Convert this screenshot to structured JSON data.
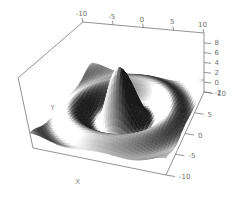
{
  "figure": {
    "background": "#ffffff"
  },
  "chart_data": {
    "type": "3d-surface",
    "title": "",
    "xlabel": "X",
    "ylabel": "Y",
    "zlabel": "",
    "x_range": [
      -10,
      10
    ],
    "y_range": [
      -10,
      10
    ],
    "z_range": [
      -2,
      10
    ],
    "z_function": "z = 8*sin(r)/r with r = sqrt(x^2 + y^2)  (sombrero surface)",
    "amplitude": 8,
    "grid_n": 48,
    "x_ticks": [
      "-10",
      "-5",
      "0",
      "5",
      "10"
    ],
    "x_tick_values": [
      -10,
      -5,
      0,
      5,
      10
    ],
    "y_ticks": [
      "10",
      "5",
      "0",
      "-5",
      "-10"
    ],
    "y_tick_values": [
      10,
      5,
      0,
      -5,
      -10
    ],
    "z_ticks": [
      "8",
      "6",
      "4",
      "2",
      "0",
      "-2"
    ],
    "z_tick_values": [
      8,
      6,
      4,
      2,
      0,
      -2
    ],
    "grid": false,
    "legend": "none",
    "shading": "grayscale-lambert",
    "light_direction": [
      -0.6,
      -0.35,
      0.72
    ],
    "colors": {
      "background": "#ffffff",
      "axis_line": "#777777",
      "tick_label": "#6e6e6e",
      "axis_title": "#8a8a8a",
      "surface_highlight": "#f8f8f8",
      "surface_mid": "#a0a0a0",
      "surface_shadow": "#141414"
    }
  }
}
